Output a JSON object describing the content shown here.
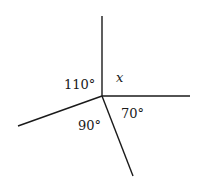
{
  "diagram": {
    "center": {
      "x": 102,
      "y": 96
    },
    "rays": [
      {
        "name": "up",
        "x2": 102,
        "y2": 16
      },
      {
        "name": "right",
        "x2": 190,
        "y2": 96
      },
      {
        "name": "down-right",
        "x2": 133,
        "y2": 176
      },
      {
        "name": "down-left",
        "x2": 18,
        "y2": 126
      }
    ],
    "angles": [
      {
        "label": "110°",
        "x": 64,
        "y": 89
      },
      {
        "label": "x",
        "x": 116,
        "y": 82
      },
      {
        "label": "70°",
        "x": 121,
        "y": 118
      },
      {
        "label": "90°",
        "x": 78,
        "y": 130
      }
    ],
    "line_color": "#1a1a1a"
  }
}
